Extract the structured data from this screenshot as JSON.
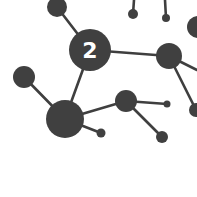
{
  "diagram": {
    "type": "network-molecule",
    "background": "#ffffff",
    "node_color": "#404040",
    "edge_color": "#3f3f3f",
    "label_color": "#ffffff",
    "center_label": "2",
    "nodes": [
      {
        "id": "top-left",
        "cx": 57,
        "cy": 7,
        "r": 10
      },
      {
        "id": "center",
        "cx": 90,
        "cy": 50,
        "r": 21,
        "label": "2"
      },
      {
        "id": "top-small-1",
        "cx": 133,
        "cy": 14,
        "r": 5
      },
      {
        "id": "top-small-2",
        "cx": 166,
        "cy": 18,
        "r": 4
      },
      {
        "id": "right-top-partial",
        "cx": 198,
        "cy": 27,
        "r": 11
      },
      {
        "id": "right",
        "cx": 169,
        "cy": 56,
        "r": 13
      },
      {
        "id": "right-edge-partial",
        "cx": 196,
        "cy": 110,
        "r": 7
      },
      {
        "id": "left",
        "cx": 24,
        "cy": 77,
        "r": 11
      },
      {
        "id": "bottom-big",
        "cx": 65,
        "cy": 119,
        "r": 19
      },
      {
        "id": "mid",
        "cx": 126,
        "cy": 101,
        "r": 11
      },
      {
        "id": "mid-small-right",
        "cx": 167,
        "cy": 104,
        "r": 3.5
      },
      {
        "id": "mid-below",
        "cx": 162,
        "cy": 137,
        "r": 6
      },
      {
        "id": "bottom-small",
        "cx": 101,
        "cy": 133,
        "r": 4.5
      }
    ],
    "edges": [
      [
        "top-left",
        "center"
      ],
      [
        "center",
        "right"
      ],
      [
        "center",
        "bottom-big"
      ],
      [
        "right",
        "right-edge-partial"
      ],
      [
        "left",
        "bottom-big"
      ],
      [
        "bottom-big",
        "mid"
      ],
      [
        "bottom-big",
        "bottom-small"
      ],
      [
        "mid",
        "mid-small-right"
      ],
      [
        "mid",
        "mid-below"
      ]
    ]
  }
}
